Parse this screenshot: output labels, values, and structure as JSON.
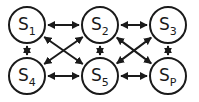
{
  "diagram": {
    "type": "state-graph",
    "nodes": [
      {
        "id": "S1",
        "label": "S",
        "subscript": "1",
        "row": 0,
        "col": 0
      },
      {
        "id": "S2",
        "label": "S",
        "subscript": "2",
        "row": 0,
        "col": 1
      },
      {
        "id": "S3",
        "label": "S",
        "subscript": "3",
        "row": 0,
        "col": 2
      },
      {
        "id": "S4",
        "label": "S",
        "subscript": "4",
        "row": 1,
        "col": 0
      },
      {
        "id": "S5",
        "label": "S",
        "subscript": "5",
        "row": 1,
        "col": 1
      },
      {
        "id": "Sp",
        "label": "S",
        "subscript": "P",
        "row": 1,
        "col": 2
      }
    ],
    "edges": [
      {
        "from": "S1",
        "to": "S2",
        "bidirectional": true
      },
      {
        "from": "S2",
        "to": "S3",
        "bidirectional": true
      },
      {
        "from": "S4",
        "to": "S5",
        "bidirectional": true
      },
      {
        "from": "S5",
        "to": "Sp",
        "bidirectional": true
      },
      {
        "from": "S1",
        "to": "S4",
        "bidirectional": true
      },
      {
        "from": "S2",
        "to": "S5",
        "bidirectional": true
      },
      {
        "from": "S3",
        "to": "Sp",
        "bidirectional": true
      },
      {
        "from": "S1",
        "to": "S5",
        "bidirectional": true
      },
      {
        "from": "S2",
        "to": "S4",
        "bidirectional": true
      },
      {
        "from": "S2",
        "to": "Sp",
        "bidirectional": true
      },
      {
        "from": "S3",
        "to": "S5",
        "bidirectional": true
      }
    ],
    "colors": {
      "stroke": "#1a1a1a",
      "fill": "#ffffff"
    }
  }
}
